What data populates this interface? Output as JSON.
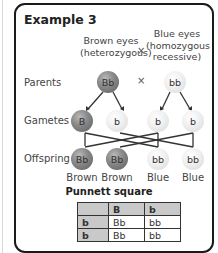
{
  "title": "Example 3",
  "parent1": {
    "label_line1": "Brown eyes",
    "label_line2": "(heterozygous)",
    "genotype": "Bb"
  },
  "parent2": {
    "label_line1": "Blue eyes",
    "label_line2": "(homozygous",
    "label_line3": "recessive)",
    "genotype": "bb"
  },
  "cross_symbol": "×",
  "rows": {
    "parents": "Parents",
    "gametes": "Gametes",
    "offspring": "Offspring"
  },
  "gametes": [
    "B",
    "b",
    "b",
    "b"
  ],
  "offspring": [
    {
      "genotype": "Bb",
      "phenotype": "Brown"
    },
    {
      "genotype": "Bb",
      "phenotype": "Brown"
    },
    {
      "genotype": "bb",
      "phenotype": "Blue"
    },
    {
      "genotype": "bb",
      "phenotype": "Blue"
    }
  ],
  "punnett": {
    "title": "Punnett square",
    "header": [
      "",
      "B",
      "b"
    ],
    "rows": [
      [
        "b",
        "Bb",
        "bb"
      ],
      [
        "b",
        "Bb",
        "bb"
      ]
    ]
  },
  "colors": {
    "dominant_ball": "#7a7a7a",
    "recessive_ball": "#eeeeee",
    "border": "#1a1a1a",
    "table_header": "#c9c9c9"
  }
}
